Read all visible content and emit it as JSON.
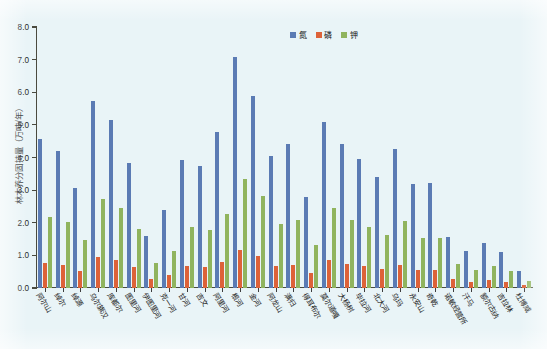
{
  "chart_data": {
    "type": "bar",
    "title": "",
    "subtitle": "",
    "xlabel": "",
    "ylabel": "林木养分固持量（万吨/年）",
    "ylim": [
      0.0,
      8.0
    ],
    "ytick_step": 1.0,
    "ytick_labels": [
      "0.0",
      "1.0",
      "2.0",
      "3.0",
      "4.0",
      "5.0",
      "6.0",
      "7.0",
      "8.0"
    ],
    "grid": false,
    "legend_position": "top-right",
    "legend": [
      "氮",
      "磷",
      "钾"
    ],
    "colors": {
      "氮": "#5b7bb4",
      "磷": "#dd6239",
      "钾": "#90b45e",
      "background": "#e9f4f7",
      "axis": "#4a4a3f"
    },
    "categories": [
      "阿尔山",
      "绰尔",
      "绰源",
      "乌尔旗汉",
      "库都尔",
      "图里河",
      "伊图里河",
      "克一河",
      "甘河",
      "吉文",
      "阿里河",
      "根河",
      "金河",
      "阿龙山",
      "满归",
      "得耳布尔",
      "莫尔道嘎",
      "大杨树",
      "毕拉河",
      "北大河",
      "乌玛",
      "永安山",
      "奇乾",
      "诺敏经营所",
      "汗马",
      "额尔古纳",
      "吉拉林",
      "杜博威"
    ],
    "series": [
      {
        "name": "氮",
        "values": [
          4.57,
          4.21,
          3.07,
          5.72,
          5.14,
          3.82,
          1.59,
          2.38,
          3.93,
          3.75,
          4.77,
          7.07,
          5.88,
          4.06,
          4.4,
          2.8,
          5.1,
          4.42,
          3.94,
          3.39,
          4.25,
          3.2,
          3.21,
          1.56,
          1.14,
          1.38,
          1.1,
          0.51
        ]
      },
      {
        "name": "磷",
        "values": [
          0.76,
          0.7,
          0.52,
          0.96,
          0.86,
          0.64,
          0.27,
          0.41,
          0.66,
          0.63,
          0.8,
          1.16,
          0.99,
          0.68,
          0.72,
          0.46,
          0.85,
          0.74,
          0.66,
          0.58,
          0.71,
          0.55,
          0.56,
          0.27,
          0.19,
          0.24,
          0.18,
          0.08
        ]
      },
      {
        "name": "钾",
        "values": [
          2.17,
          2.01,
          1.46,
          2.73,
          2.46,
          1.82,
          0.77,
          1.12,
          1.87,
          1.79,
          2.27,
          3.34,
          2.81,
          1.95,
          2.1,
          1.33,
          2.44,
          2.1,
          1.88,
          1.62,
          2.05,
          1.53,
          1.54,
          0.75,
          0.55,
          0.66,
          0.53,
          0.23
        ]
      }
    ]
  }
}
